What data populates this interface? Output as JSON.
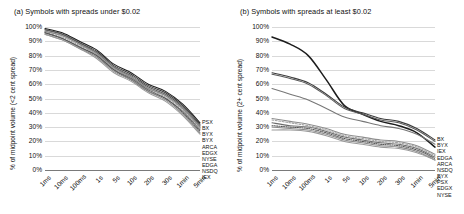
{
  "figure": {
    "panels": [
      {
        "id": "a",
        "title": "(a) Symbols with spreads under $0.02",
        "ylabel": "% of midpoint volume (<2 cent spread)"
      },
      {
        "id": "b",
        "title": "(b) Symbols with spreads at least $0.02",
        "ylabel": "% of midpoint volume (2+ cent spread)"
      }
    ]
  },
  "chart_data": [
    {
      "type": "line",
      "panel": "a",
      "title": "(a) Symbols with spreads under $0.02",
      "xlabel": "",
      "ylabel": "% of midpoint volume (<2 cent spread)",
      "categories": [
        "1ms",
        "10ms",
        "100ms",
        "1s",
        "5s",
        "10s",
        "20s",
        "30s",
        "1min",
        "5min"
      ],
      "yticks": [
        "0%",
        "10%",
        "20%",
        "30%",
        "40%",
        "50%",
        "60%",
        "70%",
        "80%",
        "90%",
        "100%"
      ],
      "ylim": [
        0,
        100
      ],
      "grid": true,
      "legend_position": "right",
      "series": [
        {
          "name": "PSX",
          "values": [
            99,
            96,
            90,
            84,
            74,
            68,
            60,
            55,
            46,
            33
          ]
        },
        {
          "name": "BX",
          "values": [
            98,
            95,
            89,
            83,
            73,
            67,
            59,
            54,
            45,
            32
          ]
        },
        {
          "name": "BYX",
          "values": [
            98,
            95,
            89,
            82,
            72,
            66,
            58,
            53,
            44,
            31
          ]
        },
        {
          "name": "BYX",
          "values": [
            97,
            94,
            88,
            82,
            72,
            65,
            57,
            52,
            43,
            30
          ]
        },
        {
          "name": "ARCA",
          "values": [
            97,
            94,
            88,
            81,
            71,
            65,
            57,
            52,
            43,
            30
          ]
        },
        {
          "name": "EDGX",
          "values": [
            96,
            93,
            87,
            81,
            71,
            64,
            56,
            51,
            42,
            29
          ]
        },
        {
          "name": "NYSE",
          "values": [
            96,
            92,
            86,
            80,
            70,
            64,
            56,
            50,
            41,
            28
          ]
        },
        {
          "name": "EDGA",
          "values": [
            96,
            92,
            86,
            80,
            70,
            63,
            55,
            50,
            40,
            27
          ]
        },
        {
          "name": "NSDQ",
          "values": [
            95,
            91,
            85,
            79,
            69,
            63,
            55,
            49,
            39,
            26
          ]
        },
        {
          "name": "IEX",
          "values": [
            95,
            91,
            85,
            78,
            68,
            62,
            54,
            48,
            38,
            25
          ]
        }
      ]
    },
    {
      "type": "line",
      "panel": "b",
      "title": "(b) Symbols with spreads at least $0.02",
      "xlabel": "",
      "ylabel": "% of midpoint volume (2+ cent spread)",
      "categories": [
        "1ms",
        "10ms",
        "100ms",
        "1s",
        "5s",
        "10s",
        "20s",
        "30s",
        "1min",
        "5min"
      ],
      "yticks": [
        "0%",
        "10%",
        "20%",
        "30%",
        "40%",
        "50%",
        "60%",
        "70%",
        "80%",
        "90%",
        "100%"
      ],
      "ylim": [
        0,
        100
      ],
      "grid": true,
      "legend_position": "right",
      "series": [
        {
          "name": "BX",
          "values": [
            93,
            88,
            80,
            63,
            45,
            39,
            34,
            31,
            26,
            16
          ]
        },
        {
          "name": "BYX",
          "values": [
            68,
            65,
            61,
            53,
            44,
            40,
            36,
            34,
            29,
            21
          ]
        },
        {
          "name": "IEX",
          "values": [
            67,
            64,
            60,
            52,
            43,
            39,
            35,
            33,
            28,
            20
          ]
        },
        {
          "name": "EDGA",
          "values": [
            57,
            53,
            49,
            43,
            37,
            34,
            31,
            29,
            25,
            18
          ]
        },
        {
          "name": "ARCA",
          "values": [
            36,
            34,
            32,
            29,
            25,
            23,
            21,
            20,
            17,
            11
          ]
        },
        {
          "name": "NSDQ",
          "values": [
            35,
            33,
            31,
            28,
            24,
            22,
            20,
            19,
            16,
            10
          ]
        },
        {
          "name": "BYX",
          "values": [
            33,
            31,
            30,
            27,
            23,
            21,
            19,
            18,
            15,
            9
          ]
        },
        {
          "name": "PSX",
          "values": [
            31,
            30,
            29,
            26,
            22,
            20,
            18,
            17,
            14,
            8
          ]
        },
        {
          "name": "EDGX",
          "values": [
            30,
            29,
            28,
            25,
            21,
            19,
            17,
            16,
            13,
            7
          ]
        },
        {
          "name": "NYSE",
          "values": [
            28,
            28,
            27,
            24,
            20,
            18,
            16,
            15,
            12,
            7
          ]
        }
      ]
    }
  ]
}
